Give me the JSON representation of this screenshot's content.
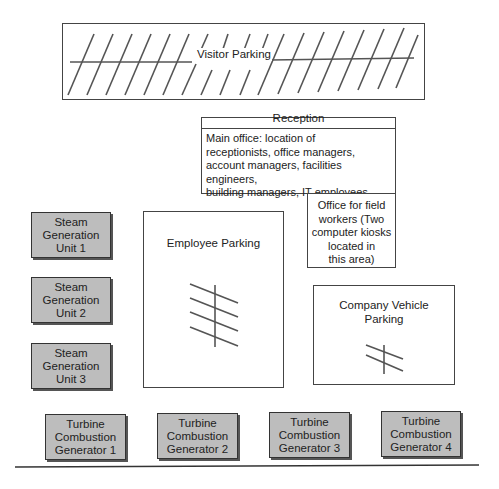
{
  "diagram": {
    "visitor_parking": {
      "label": "Visitor Parking"
    },
    "reception": {
      "title": "Reception",
      "main_office_lines": [
        "Main office: location of",
        "receptionists, office managers,",
        "account managers, facilities engineers,",
        "building managers, IT employees"
      ],
      "field_office_lines": [
        "Office for field",
        "workers (Two",
        "computer kiosks",
        "located in",
        "this area)"
      ]
    },
    "employee_parking": {
      "label": "Employee Parking"
    },
    "company_vehicle_parking": {
      "lines": [
        "Company Vehicle",
        "Parking"
      ]
    },
    "steam_units": [
      {
        "lines": [
          "Steam",
          "Generation",
          "Unit 1"
        ]
      },
      {
        "lines": [
          "Steam",
          "Generation",
          "Unit 2"
        ]
      },
      {
        "lines": [
          "Steam",
          "Generation",
          "Unit 3"
        ]
      }
    ],
    "turbines": [
      {
        "lines": [
          "Turbine",
          "Combustion",
          "Generator 1"
        ]
      },
      {
        "lines": [
          "Turbine",
          "Combustion",
          "Generator 2"
        ]
      },
      {
        "lines": [
          "Turbine",
          "Combustion",
          "Generator 3"
        ]
      },
      {
        "lines": [
          "Turbine",
          "Combustion",
          "Generator 4"
        ]
      }
    ],
    "colors": {
      "unit_fill": "#bdbdbd",
      "stroke": "#444444"
    }
  }
}
